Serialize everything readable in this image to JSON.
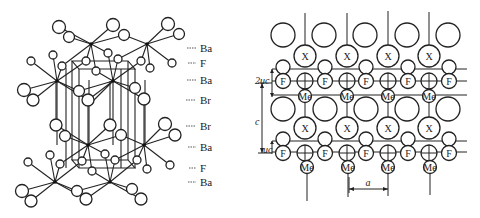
{
  "figure": {
    "left_panel": {
      "title": "BaFBr crystal structure (3D perspective)",
      "layer_labels": [
        "Ba",
        "F",
        "Ba",
        "Br",
        "Br",
        "Ba",
        "F",
        "Ba"
      ]
    },
    "right_panel": {
      "title": "Layered MeFX structure projection",
      "atom_labels": {
        "halogen": "X",
        "fluorine": "F",
        "metal": "Me"
      },
      "dimension_labels": {
        "two_uc": "2uc",
        "c": "c",
        "uc": "uc",
        "a": "a"
      }
    }
  }
}
